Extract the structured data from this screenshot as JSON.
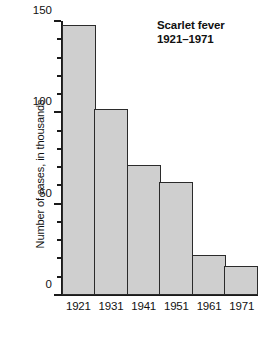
{
  "chart_data": {
    "type": "bar",
    "title": "Scarlet fever\n1921–1971",
    "title_lines": [
      "Scarlet fever",
      "1921–1971"
    ],
    "xlabel": "",
    "ylabel": "Number of cases, in thousands",
    "categories": [
      "1921",
      "1931",
      "1941",
      "1951",
      "1961",
      "1971"
    ],
    "values": [
      148,
      102,
      71,
      62,
      22,
      16
    ],
    "ylim": [
      0,
      150
    ],
    "y_major_ticks": [
      0,
      50,
      100,
      150
    ],
    "y_major_tick_labels": [
      "0",
      "50",
      "100",
      "150"
    ],
    "y_minor_ticks": [
      10,
      20,
      30,
      40,
      60,
      70,
      80,
      90,
      110,
      120,
      130,
      140
    ],
    "grid": false,
    "legend": false,
    "bar_fill_color": "#cfcfcf",
    "bar_edge_color": "#2b2b2b",
    "axis_color": "#1a1a1a",
    "background_color": "#ffffff"
  }
}
